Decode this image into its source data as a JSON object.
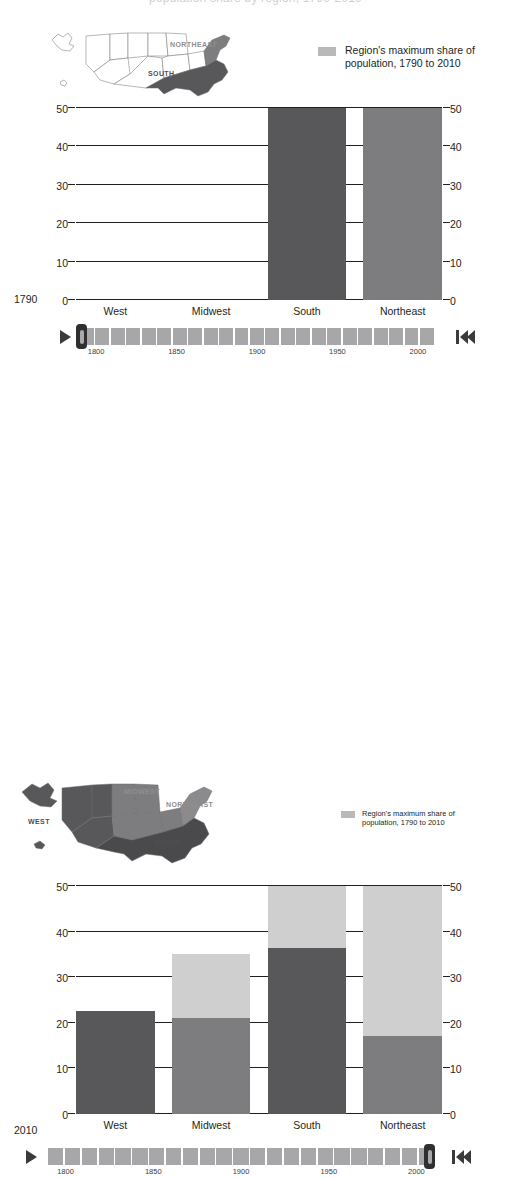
{
  "page": {
    "clipped_headline": "population share by region, 1790-2010"
  },
  "colors": {
    "dark": "#58585a",
    "mid": "#7d7d7f",
    "light": "#cfcfd0",
    "map_unshaded": "#ffffff",
    "map_outline": "#6f6f71",
    "legend_swatch": "#b9b9ba",
    "track": "#a7a7a9",
    "handle": "#2f2f31",
    "axis": "#231f20"
  },
  "legend": {
    "swatch_icon": "legend-swatch",
    "line1": "Region's maximum share of",
    "line2": "population, 1790 to 2010"
  },
  "panels": [
    {
      "id": "panel-1",
      "year": "1790",
      "map": {
        "name": "us-regions-map-1790",
        "labels": [
          {
            "id": "m1-ne",
            "text": "NORTHEAST",
            "tone": "mid"
          },
          {
            "id": "m1-south",
            "text": "SOUTH",
            "tone": "dark"
          }
        ]
      },
      "chart_index": 0
    },
    {
      "id": "panel-2",
      "year": "2010",
      "map": {
        "name": "us-regions-map-2010",
        "labels": [
          {
            "id": "m2-mw",
            "text": "MIDWEST",
            "tone": "mid"
          },
          {
            "id": "m2-ne",
            "text": "NORTHEAST",
            "tone": "mid"
          },
          {
            "id": "m2-west",
            "text": "WEST",
            "tone": "dark"
          },
          {
            "id": "m2-south",
            "text": "SOUTH",
            "tone": "dark"
          }
        ]
      },
      "chart_index": 1
    }
  ],
  "timeline": {
    "play_icon": "play-icon",
    "skip_icon": "skip-to-start-icon",
    "start_year": 1790,
    "end_year": 2010,
    "step": 10,
    "segment_count": 23,
    "axis_years": [
      "1800",
      "1850",
      "1900",
      "1950",
      "2000"
    ],
    "panels": [
      {
        "current_year": "1790",
        "handle_position_pct": 0
      },
      {
        "current_year": "2010",
        "handle_position_pct": 100
      }
    ]
  },
  "chart_data": [
    {
      "type": "bar",
      "title": "",
      "subtitle": "1790",
      "xlabel": "",
      "ylabel": "",
      "ylim": [
        0,
        50
      ],
      "yticks": [
        0,
        10,
        20,
        30,
        40,
        50
      ],
      "grid": true,
      "legend_position": "top-right",
      "categories": [
        "West",
        "Midwest",
        "South",
        "Northeast"
      ],
      "series": [
        {
          "name": "Share of population in year",
          "color_key": "current",
          "values": [
            0,
            0,
            50,
            50
          ]
        },
        {
          "name": "Region's maximum share of population, 1790 to 2010",
          "color_key": "light",
          "values": [
            0,
            0,
            50,
            50
          ]
        }
      ],
      "bar_colors": [
        "dark",
        "dark",
        "dark",
        "mid"
      ]
    },
    {
      "type": "bar",
      "title": "",
      "subtitle": "2010",
      "xlabel": "",
      "ylabel": "",
      "ylim": [
        0,
        50
      ],
      "yticks": [
        0,
        10,
        20,
        30,
        40,
        50
      ],
      "grid": true,
      "legend_position": "top-right",
      "categories": [
        "West",
        "Midwest",
        "South",
        "Northeast"
      ],
      "series": [
        {
          "name": "Share of population in year",
          "color_key": "current",
          "values": [
            22.5,
            21.0,
            36.5,
            17.0
          ]
        },
        {
          "name": "Region's maximum share of population, 1790 to 2010",
          "color_key": "light",
          "values": [
            22.5,
            35.0,
            50.0,
            50.0
          ]
        }
      ],
      "bar_colors": [
        "dark",
        "mid",
        "dark",
        "mid"
      ]
    }
  ]
}
